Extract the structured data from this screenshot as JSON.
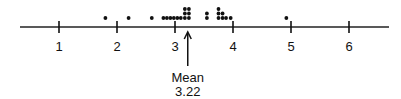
{
  "chart_data": {
    "type": "scatter",
    "subtype": "dot-plot",
    "title": "",
    "xlabel": "",
    "ylabel": "",
    "xlim": [
      0.3,
      6.7
    ],
    "ticks": [
      1,
      2,
      3,
      4,
      5,
      6
    ],
    "tick_labels": [
      "1",
      "2",
      "3",
      "4",
      "5",
      "6"
    ],
    "grid": false,
    "points": [
      {
        "x": 1.8,
        "level": 0
      },
      {
        "x": 2.2,
        "level": 0
      },
      {
        "x": 2.6,
        "level": 0
      },
      {
        "x": 2.8,
        "level": 0
      },
      {
        "x": 2.86,
        "level": 0
      },
      {
        "x": 2.92,
        "level": 0
      },
      {
        "x": 2.98,
        "level": 0
      },
      {
        "x": 3.04,
        "level": 0
      },
      {
        "x": 3.1,
        "level": 0
      },
      {
        "x": 3.17,
        "level": 0
      },
      {
        "x": 3.17,
        "level": 1
      },
      {
        "x": 3.17,
        "level": 2
      },
      {
        "x": 3.24,
        "level": 0
      },
      {
        "x": 3.24,
        "level": 1
      },
      {
        "x": 3.24,
        "level": 2
      },
      {
        "x": 3.55,
        "level": 0
      },
      {
        "x": 3.55,
        "level": 1
      },
      {
        "x": 3.75,
        "level": 0
      },
      {
        "x": 3.75,
        "level": 1
      },
      {
        "x": 3.75,
        "level": 2
      },
      {
        "x": 3.82,
        "level": 0
      },
      {
        "x": 3.82,
        "level": 1
      },
      {
        "x": 3.88,
        "level": 0
      },
      {
        "x": 3.96,
        "level": 0
      },
      {
        "x": 4.92,
        "level": 0
      }
    ],
    "annotations": [
      {
        "type": "arrow",
        "x": 3.22,
        "label_line1": "Mean",
        "label_line2": "3.22"
      }
    ]
  },
  "labels": {
    "mean_title": "Mean",
    "mean_value": "3.22"
  },
  "colors": {
    "ink": "#111111",
    "background": "#ffffff"
  }
}
